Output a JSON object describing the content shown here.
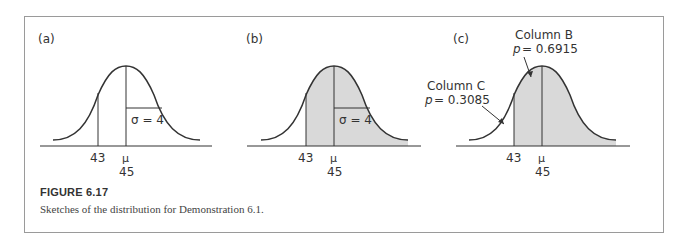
{
  "figure": {
    "number_label": "FIGURE 6.17",
    "caption": "Sketches of the distribution for Demonstration 6.1."
  },
  "panels": [
    {
      "label": "(a)",
      "sigma_label": "σ = 4",
      "x_value": "43",
      "mean_symbol": "μ",
      "mean_value": "45",
      "shaded": "none"
    },
    {
      "label": "(b)",
      "sigma_label": "σ = 4",
      "x_value": "43",
      "mean_symbol": "μ",
      "mean_value": "45",
      "shaded": "right of 43"
    },
    {
      "label": "(c)",
      "x_value": "43",
      "mean_symbol": "μ",
      "mean_value": "45",
      "shaded": "right of 43",
      "annotations": [
        {
          "title": "Column B",
          "p_label": "p",
          "p_value": "= 0.6915"
        },
        {
          "title": "Column C",
          "p_label": "p",
          "p_value": "= 0.3085"
        }
      ]
    }
  ],
  "colors": {
    "shade": "#d9d9d9",
    "line": "#333333",
    "border": "#9a9a9a"
  }
}
